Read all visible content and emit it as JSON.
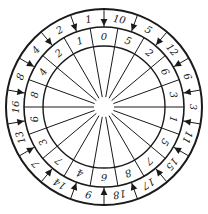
{
  "diagram": {
    "title": "",
    "center": [
      104,
      107
    ],
    "radii": {
      "outer": 98,
      "middle": 80,
      "inner": 61,
      "hub": 10
    },
    "segments": 18,
    "start_angle_deg": -90,
    "outer_ring": [
      "10",
      "5",
      "12",
      "6",
      "3",
      "11",
      "15",
      "17",
      "18",
      "9",
      "14",
      "7",
      "13",
      "16",
      "8",
      "4",
      "2",
      "1"
    ],
    "inner_ring": [
      "5",
      "2",
      "6",
      "3",
      "1",
      "5",
      "7",
      "8",
      "6",
      "4",
      "7",
      "3",
      "6",
      "8",
      "4",
      "2",
      "1",
      "0"
    ],
    "colors": {
      "ink": "#1a1a1a",
      "background": "#ffffff"
    }
  }
}
